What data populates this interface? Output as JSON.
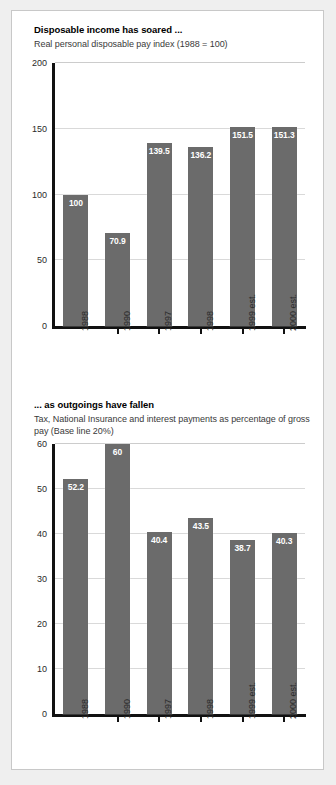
{
  "chart_data": [
    {
      "type": "bar",
      "title": "Disposable income has soared ...",
      "subtitle": "Real personal disposable pay index (1988 = 100)",
      "categories": [
        "1988",
        "1990",
        "1997",
        "1998",
        "1999 est.",
        "2000 est."
      ],
      "values": [
        100,
        70.9,
        139.5,
        136.2,
        151.5,
        151.3
      ],
      "value_labels": [
        "100",
        "70.9",
        "139.5",
        "136.2",
        "151.5",
        "151.3"
      ],
      "yticks": [
        0,
        50,
        100,
        150,
        200
      ],
      "ytick_labels": [
        "0",
        "50",
        "100",
        "150",
        "200"
      ],
      "ylim": [
        0,
        200
      ],
      "xlabel": "",
      "ylabel": "",
      "grid": true,
      "legend": false,
      "bar_color": "#6b6b6b",
      "value_label_color": "#ffffff"
    },
    {
      "type": "bar",
      "title": "... as outgoings have fallen",
      "subtitle": "Tax, National Insurance and interest payments as percentage of gross pay (Base line 20%)",
      "categories": [
        "1988",
        "1990",
        "1997",
        "1998",
        "1999 est.",
        "2000 est."
      ],
      "values": [
        52.2,
        60,
        40.4,
        43.5,
        38.7,
        40.3
      ],
      "value_labels": [
        "52.2",
        "60",
        "40.4",
        "43.5",
        "38.7",
        "40.3"
      ],
      "yticks": [
        0,
        10,
        20,
        30,
        40,
        50,
        60
      ],
      "ytick_labels": [
        "0",
        "10",
        "20",
        "30",
        "40",
        "50",
        "60"
      ],
      "ylim": [
        0,
        60
      ],
      "xlabel": "",
      "ylabel": "",
      "grid": true,
      "legend": false,
      "bar_color": "#6b6b6b",
      "value_label_color": "#ffffff"
    }
  ]
}
